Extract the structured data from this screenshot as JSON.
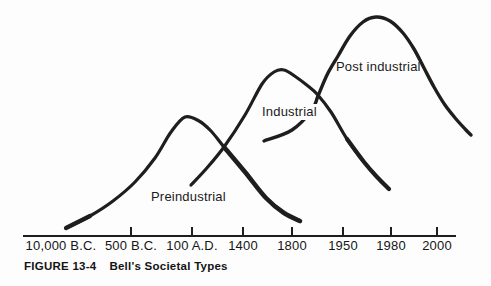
{
  "colors": {
    "ink": "#1e1e1e",
    "paper": "#fdfdfd"
  },
  "figure": {
    "caption": {
      "label": "FIGURE 13-4",
      "title": "Bell's Societal Types"
    }
  },
  "chart_data": {
    "type": "line",
    "title": "Bell's Societal Types",
    "legend_position": "labels-on-curves",
    "grid": false,
    "x_axis": {
      "axis": {
        "x1": 23,
        "x2": 456,
        "y": 236,
        "tick_len": 9,
        "line_width": 2.2,
        "tick_width": 2
      },
      "ticks": [
        {
          "label": "10,000 B.C.",
          "x": 61,
          "tick": false
        },
        {
          "label": "500 B.C.",
          "x": 131,
          "tick": true
        },
        {
          "label": "100 A.D.",
          "x": 192,
          "tick": true
        },
        {
          "label": "1400",
          "x": 243,
          "tick": true
        },
        {
          "label": "1800",
          "x": 292,
          "tick": true
        },
        {
          "label": "1950",
          "x": 343,
          "tick": true
        },
        {
          "label": "1980",
          "x": 391,
          "tick": true
        },
        {
          "label": "2000",
          "x": 437,
          "tick": true
        }
      ]
    },
    "series": [
      {
        "name": "Preindustrial",
        "peak_era": "100 A.D.",
        "span_eras": [
          "10,000 B.C.",
          "1800"
        ],
        "label_pos": {
          "x": 151,
          "y": 189
        },
        "width": 3.2,
        "points": [
          [
            66,
            228
          ],
          [
            90,
            216
          ],
          [
            113,
            201
          ],
          [
            135,
            182
          ],
          [
            155,
            158
          ],
          [
            171,
            132
          ],
          [
            185,
            117
          ],
          [
            199,
            121
          ],
          [
            211,
            131
          ],
          [
            224,
            147
          ],
          [
            245,
            172
          ],
          [
            266,
            198
          ],
          [
            284,
            213
          ],
          [
            300,
            221
          ]
        ],
        "thick": [
          {
            "start": 0,
            "end": 1,
            "width": 4.2
          },
          {
            "start": 9,
            "end": 13,
            "width": 4.6
          }
        ]
      },
      {
        "name": "Industrial",
        "peak_era": "1800",
        "span_eras": [
          "100 A.D.",
          "1950"
        ],
        "label_pos": {
          "x": 261,
          "y": 104
        },
        "width": 3.2,
        "points": [
          [
            191,
            185
          ],
          [
            206,
            169
          ],
          [
            224,
            147
          ],
          [
            245,
            115
          ],
          [
            262,
            84
          ],
          [
            274,
            72
          ],
          [
            284,
            70
          ],
          [
            296,
            77
          ],
          [
            308,
            86
          ],
          [
            317,
            94
          ],
          [
            331,
            112
          ],
          [
            347,
            139
          ],
          [
            364,
            162
          ],
          [
            377,
            177
          ],
          [
            389,
            189
          ]
        ],
        "thick": [
          {
            "start": 11,
            "end": 14,
            "width": 4.2
          }
        ]
      },
      {
        "name": "Post industrial",
        "peak_era": "1980",
        "span_eras": [
          "1400",
          "2000+"
        ],
        "label_pos": {
          "x": 336,
          "y": 59
        },
        "width": 3.4,
        "points": [
          [
            264,
            141
          ],
          [
            292,
            130
          ],
          [
            312,
            110
          ],
          [
            318,
            96
          ],
          [
            327,
            75
          ],
          [
            338,
            56
          ],
          [
            350,
            36
          ],
          [
            363,
            22
          ],
          [
            376,
            17
          ],
          [
            390,
            21
          ],
          [
            403,
            33
          ],
          [
            414,
            49
          ],
          [
            424,
            68
          ],
          [
            434,
            87
          ],
          [
            445,
            105
          ],
          [
            456,
            119
          ],
          [
            466,
            130
          ],
          [
            471,
            135
          ]
        ],
        "thick": []
      }
    ]
  }
}
